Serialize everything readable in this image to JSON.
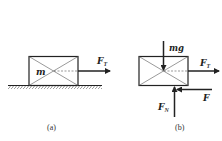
{
  "figure": {
    "panels": [
      {
        "id": "a",
        "caption": "(a)",
        "mass_label": "m",
        "forces": [
          {
            "name": "tension",
            "symbol": "F",
            "subscript": "T",
            "direction": "right"
          }
        ],
        "surface": "ground-hatched"
      },
      {
        "id": "b",
        "caption": "(b)",
        "forces": [
          {
            "name": "gravity",
            "symbol": "mg",
            "subscript": "",
            "direction": "down"
          },
          {
            "name": "tension",
            "symbol": "F",
            "subscript": "T",
            "direction": "right"
          },
          {
            "name": "friction",
            "symbol": "F",
            "subscript": "",
            "direction": "left"
          },
          {
            "name": "normal",
            "symbol": "F",
            "subscript": "N",
            "direction": "up"
          }
        ]
      }
    ]
  },
  "colors": {
    "line": "#222222",
    "thin_line": "#555555",
    "background": "#ffffff"
  }
}
